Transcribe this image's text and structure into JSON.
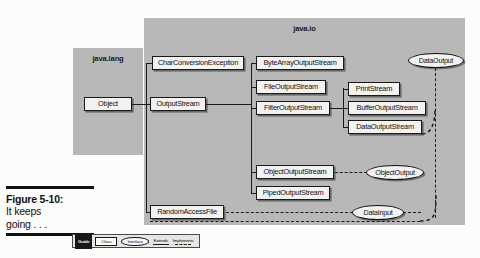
{
  "figure": {
    "caption_label": "Figure 5-10:",
    "caption_line2": "It keeps",
    "caption_line3": "going . . ."
  },
  "packages": [
    {
      "name": "java.lang",
      "x": 73,
      "y": 48,
      "w": 70,
      "h": 107
    },
    {
      "name": "java.io",
      "x": 144,
      "y": 18,
      "w": 321,
      "h": 207
    }
  ],
  "classes": {
    "object": {
      "label": "Object",
      "x": 84,
      "y": 97,
      "w": 48
    },
    "char_conversion_exception": {
      "label": "CharConversionException",
      "x": 152,
      "y": 56,
      "w": 92
    },
    "output_stream": {
      "label": "OutputStream",
      "x": 150,
      "y": 97,
      "w": 56
    },
    "byte_array_output_stream": {
      "label": "ByteArrayOutputStream",
      "x": 256,
      "y": 56,
      "w": 88
    },
    "file_output_stream": {
      "label": "FileOutputStream",
      "x": 256,
      "y": 80,
      "w": 70
    },
    "filter_output_stream": {
      "label": "FilterOutputStream",
      "x": 256,
      "y": 101,
      "w": 74
    },
    "print_stream": {
      "label": "PrintStream",
      "x": 348,
      "y": 82,
      "w": 52
    },
    "buffer_output_stream": {
      "label": "BufferOutputStream",
      "x": 348,
      "y": 101,
      "w": 78
    },
    "data_output_stream": {
      "label": "DataOutputStream",
      "x": 348,
      "y": 120,
      "w": 74
    },
    "object_output_stream": {
      "label": "ObjectOutputStream",
      "x": 256,
      "y": 165,
      "w": 78
    },
    "piped_output_stream": {
      "label": "PipedOutputStream",
      "x": 256,
      "y": 186,
      "w": 74
    },
    "random_access_file": {
      "label": "RandomAccessFile",
      "x": 150,
      "y": 205,
      "w": 74
    }
  },
  "interfaces": {
    "data_output": {
      "label": "DataOutput",
      "x": 408,
      "y": 53,
      "w": 56
    },
    "object_output": {
      "label": "ObjectOutput",
      "x": 366,
      "y": 165,
      "w": 58
    },
    "data_input": {
      "label": "DataInput",
      "x": 352,
      "y": 205,
      "w": 52
    }
  },
  "legend": {
    "guide": "Guide",
    "class_label": "Class",
    "interface_label": "Interface",
    "extends_label": "Extends",
    "implements_label": "Implements"
  }
}
